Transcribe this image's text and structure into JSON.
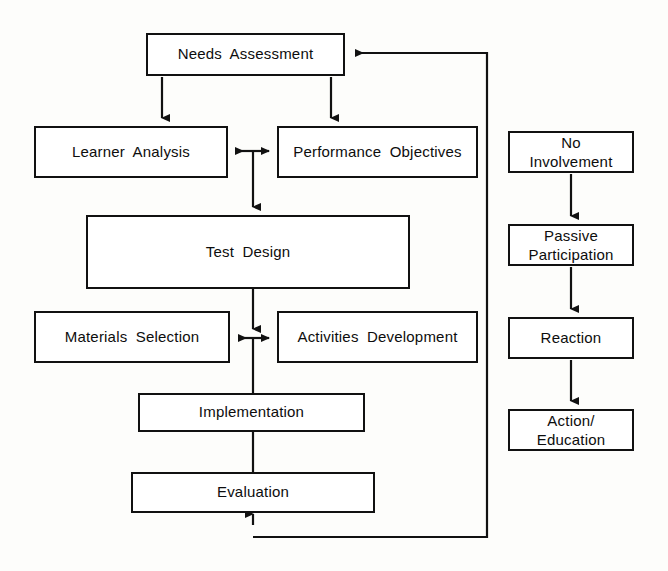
{
  "diagram": {
    "background_color": "#fdfdfb",
    "line_color": "#111111",
    "box_fill": "#ffffff",
    "main_process": {
      "nodes": [
        {
          "id": "needs-assessment",
          "label": "Needs  Assessment",
          "x": 146,
          "y": 33,
          "w": 199,
          "h": 43
        },
        {
          "id": "learner-analysis",
          "label": "Learner  Analysis",
          "x": 34,
          "y": 126,
          "w": 194,
          "h": 52
        },
        {
          "id": "performance-objectives",
          "label": "Performance  Objectives",
          "x": 277,
          "y": 126,
          "w": 201,
          "h": 52
        },
        {
          "id": "test-design",
          "label": "Test  Design",
          "x": 86,
          "y": 215,
          "w": 324,
          "h": 74
        },
        {
          "id": "materials-selection",
          "label": "Materials  Selection",
          "x": 34,
          "y": 311,
          "w": 196,
          "h": 52
        },
        {
          "id": "activities-development",
          "label": "Activities  Development",
          "x": 277,
          "y": 311,
          "w": 201,
          "h": 52
        },
        {
          "id": "implementation",
          "label": "Implementation",
          "x": 138,
          "y": 393,
          "w": 227,
          "h": 39
        },
        {
          "id": "evaluation",
          "label": "Evaluation",
          "x": 131,
          "y": 472,
          "w": 244,
          "h": 41
        }
      ]
    },
    "involvement_ladder": {
      "nodes": [
        {
          "id": "no-involvement",
          "label": "No\nInvolvement",
          "x": 508,
          "y": 131,
          "w": 126,
          "h": 42
        },
        {
          "id": "passive-participation",
          "label": "Passive\nParticipation",
          "x": 508,
          "y": 224,
          "w": 126,
          "h": 42
        },
        {
          "id": "reaction",
          "label": "Reaction",
          "x": 508,
          "y": 317,
          "w": 126,
          "h": 42
        },
        {
          "id": "action-education",
          "label": "Action/\nEducation",
          "x": 508,
          "y": 409,
          "w": 126,
          "h": 42
        }
      ]
    },
    "connections": [
      {
        "id": "needs-to-learner",
        "from": "needs-assessment",
        "to": "learner-analysis",
        "type": "arrow-down"
      },
      {
        "id": "needs-to-objectives",
        "from": "needs-assessment",
        "to": "performance-objectives",
        "type": "arrow-down"
      },
      {
        "id": "learner-objectives-bidir",
        "from": "learner-analysis",
        "to": "performance-objectives",
        "type": "bidirectional"
      },
      {
        "id": "objectives-to-test-design",
        "from": "performance-objectives",
        "to": "test-design",
        "type": "arrow-down"
      },
      {
        "id": "test-design-to-materials",
        "from": "test-design",
        "to": "materials-selection",
        "type": "arrow-down"
      },
      {
        "id": "materials-activities-bidir",
        "from": "materials-selection",
        "to": "activities-development",
        "type": "bidirectional"
      },
      {
        "id": "to-implementation",
        "from": "materials-selection",
        "to": "implementation",
        "type": "line"
      },
      {
        "id": "implementation-to-evaluation",
        "from": "implementation",
        "to": "evaluation",
        "type": "line"
      },
      {
        "id": "evaluation-feedback-loop",
        "from": "evaluation",
        "to": "needs-assessment",
        "type": "feedback-arrow"
      },
      {
        "id": "no-involvement-to-passive",
        "from": "no-involvement",
        "to": "passive-participation",
        "type": "arrow-down"
      },
      {
        "id": "passive-to-reaction",
        "from": "passive-participation",
        "to": "reaction",
        "type": "arrow-down"
      },
      {
        "id": "reaction-to-action",
        "from": "reaction",
        "to": "action-education",
        "type": "arrow-down"
      }
    ]
  }
}
